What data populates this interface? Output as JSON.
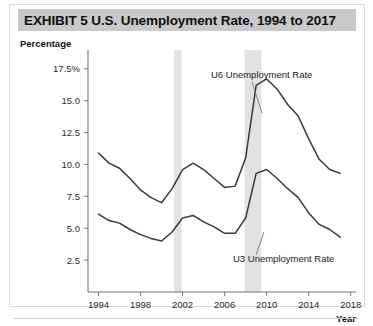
{
  "figure": {
    "exhibit_label": "EXHIBIT 5",
    "title": "EXHIBIT 5   U.S. Unemployment Rate, 1994 to 2017"
  },
  "axes": {
    "y_axis_title": "Percentage",
    "x_axis_title": "Year",
    "y_ticks": [
      "2.5",
      "5.0",
      "7.5",
      "10.0",
      "12.5",
      "15.0",
      "17.5%"
    ],
    "x_ticks": [
      "1994",
      "1998",
      "2002",
      "2006",
      "2010",
      "2014",
      "2018"
    ]
  },
  "annotations": {
    "u6_label": "U6 Unemployment Rate",
    "u3_label": "U3 Unemployment Rate"
  },
  "colors": {
    "title_band": "#c9c9c9",
    "curve": "#3a3a3a",
    "recession_band": "#e2e2e2",
    "axis": "#777777",
    "frame": "#d9d9d9"
  },
  "chart_data": {
    "type": "line",
    "title": "EXHIBIT 5   U.S. Unemployment Rate, 1994 to 2017",
    "xlabel": "Year",
    "ylabel": "Percentage",
    "xlim": [
      1993,
      2018.5
    ],
    "ylim": [
      0,
      18.5
    ],
    "grid": false,
    "legend": "inline-annotations",
    "x": [
      1994,
      1995,
      1996,
      1997,
      1998,
      1999,
      2000,
      2001,
      2002,
      2003,
      2004,
      2005,
      2006,
      2007,
      2008,
      2009,
      2010,
      2011,
      2012,
      2013,
      2014,
      2015,
      2016,
      2017
    ],
    "series": [
      {
        "name": "U6 Unemployment Rate",
        "values": [
          10.9,
          10.1,
          9.7,
          8.9,
          8.0,
          7.4,
          7.0,
          8.1,
          9.6,
          10.1,
          9.6,
          8.9,
          8.2,
          8.3,
          10.5,
          16.2,
          16.7,
          15.9,
          14.7,
          13.8,
          12.0,
          10.4,
          9.6,
          9.3
        ]
      },
      {
        "name": "U3 Unemployment Rate",
        "values": [
          6.1,
          5.6,
          5.4,
          4.9,
          4.5,
          4.2,
          4.0,
          4.7,
          5.8,
          6.0,
          5.5,
          5.1,
          4.6,
          4.6,
          5.8,
          9.3,
          9.6,
          8.9,
          8.1,
          7.4,
          6.2,
          5.3,
          4.9,
          4.3
        ]
      }
    ],
    "shaded_regions": [
      {
        "name": "recession-2001",
        "x_start": 2001.2,
        "x_end": 2001.9
      },
      {
        "name": "recession-2008",
        "x_start": 2007.9,
        "x_end": 2009.5
      }
    ]
  }
}
